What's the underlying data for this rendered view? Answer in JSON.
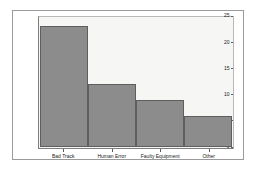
{
  "chart_data": {
    "type": "bar",
    "title": "",
    "xlabel": "",
    "ylabel": "Frequency",
    "categories": [
      "Bad Track",
      "Human Error",
      "Faulty Equipment",
      "Other"
    ],
    "values": [
      23,
      12,
      9,
      6
    ],
    "ylim": [
      0,
      25
    ],
    "yticks": [
      0,
      5,
      10,
      15,
      20,
      25
    ],
    "ytick_labels": [
      "0",
      "5",
      "10",
      "15",
      "20",
      "25"
    ],
    "grid": false,
    "legend": false,
    "bar_color": "#8c8c8c",
    "bar_edge_color": "#5e5e5e",
    "plot_background": "#f6f6f4",
    "figure_background": "#ffffff",
    "axis_color": "#7d7d7d",
    "text_color": "#1a1a1a"
  }
}
